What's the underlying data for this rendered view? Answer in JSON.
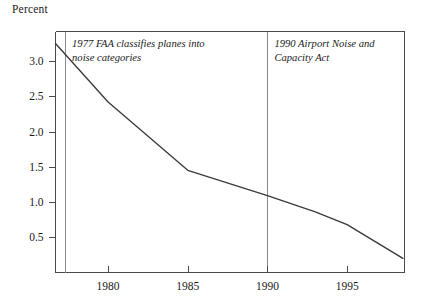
{
  "figure": {
    "axis_title": "Percent",
    "line_color": "#3a3a3a",
    "frame_color": "#4a4a4a",
    "event_line_color": "#8a8a8a",
    "background": "#ffffff"
  },
  "chart_data": {
    "type": "line",
    "title": "",
    "subtitle": "",
    "xlabel": "",
    "ylabel": "Percent",
    "xlim": [
      1976.7,
      1998.6
    ],
    "ylim": [
      0.0,
      3.42
    ],
    "grid": false,
    "legend": "none",
    "x_ticks": [
      1980,
      1985,
      1990,
      1995
    ],
    "x_tick_labels": [
      "1980",
      "1985",
      "1990",
      "1995"
    ],
    "y_ticks": [
      0.5,
      1.0,
      1.5,
      2.0,
      2.5,
      3.0
    ],
    "y_tick_labels": [
      "0.5",
      "1.0",
      "1.5",
      "2.0",
      "2.5",
      "3.0"
    ],
    "series": [
      {
        "name": "Percent",
        "x": [
          1976.7,
          1980.0,
          1985.0,
          1990.0,
          1993.0,
          1995.0,
          1998.5
        ],
        "values": [
          3.25,
          2.42,
          1.45,
          1.09,
          0.86,
          0.68,
          0.2
        ]
      }
    ],
    "annotations": [
      {
        "id": "faa-1977",
        "x": 1977.3,
        "lines": [
          "1977 FAA classifies planes into",
          "noise categories"
        ],
        "text": "1977 FAA classifies planes into noise categories",
        "style": "italic",
        "marker": "vertical-line"
      },
      {
        "id": "anca-1990",
        "x": 1990.0,
        "lines": [
          "1990 Airport Noise and",
          "Capacity Act"
        ],
        "text": "1990 Airport Noise and Capacity Act",
        "style": "italic",
        "marker": "vertical-line"
      }
    ]
  }
}
